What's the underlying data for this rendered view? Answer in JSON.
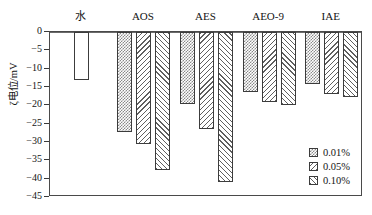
{
  "chart_data": {
    "type": "bar",
    "title": "",
    "subtitle": "",
    "xlabel": "",
    "ylabel": "ζ电位/mV",
    "categories": [
      "水",
      "AOS",
      "AES",
      "AEO-9",
      "IAE"
    ],
    "series": [
      {
        "name": "0.01%",
        "pattern": "checker",
        "values": [
          null,
          -27.3,
          -19.7,
          -16.3,
          -14.3
        ]
      },
      {
        "name": "0.05%",
        "pattern": "backward-hatch",
        "values": [
          null,
          -30.5,
          -26.5,
          -19.0,
          -16.8
        ]
      },
      {
        "name": "0.10%",
        "pattern": "forward-hatch",
        "values": [
          null,
          -37.5,
          -40.8,
          -20.0,
          -17.6
        ]
      }
    ],
    "baseline_series": {
      "name": "水",
      "pattern": "none",
      "value": -13.0
    },
    "ylim": [
      -45,
      0
    ],
    "yticks": [
      0,
      -5,
      -10,
      -15,
      -20,
      -25,
      -30,
      -35,
      -40,
      -45
    ],
    "ytick_labels": [
      "0",
      "−5",
      "−10",
      "−15",
      "−20",
      "−25",
      "−30",
      "−35",
      "−40",
      "−45"
    ],
    "grid": false,
    "legend_position": "bottom-right",
    "legend_entries": [
      "0.01%",
      "0.05%",
      "0.10%"
    ]
  },
  "colors": {
    "axis": "#4a4a4a",
    "bar_outline": "#3c3c3c",
    "pattern": "#5f5f5f",
    "text": "#141414",
    "background": "#ffffff"
  }
}
